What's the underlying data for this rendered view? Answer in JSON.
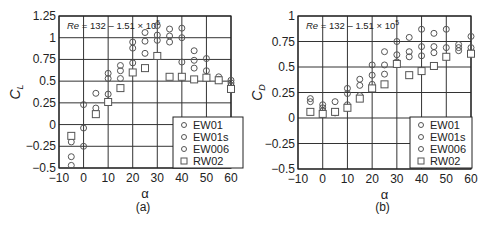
{
  "chart_data": [
    {
      "id": "a",
      "type": "scatter",
      "caption": "(a)",
      "annotation": "Re = 132 – 1.51 × 10^5",
      "xlabel": "α",
      "ylabel": "C_L",
      "xlim": [
        -10,
        60
      ],
      "ylim": [
        -0.5,
        1.25
      ],
      "xticks": [
        "-10",
        "0",
        "10",
        "20",
        "30",
        "40",
        "50",
        "60"
      ],
      "yticks": [
        "-0.5",
        "-0.25",
        "0",
        "0.25",
        "0.5",
        "0.75",
        "1",
        "1.25"
      ],
      "grid": true,
      "legend_position": "lower right",
      "legend": [
        {
          "name": "EW01",
          "marker": "circle"
        },
        {
          "name": "EW01s",
          "marker": "circle"
        },
        {
          "name": "EW006",
          "marker": "circle"
        },
        {
          "name": "RW02",
          "marker": "square"
        }
      ],
      "series": [
        {
          "name": "EW01 / EW01s / EW006",
          "marker": "circle",
          "points": [
            [
              -5,
              -0.2
            ],
            [
              -5,
              -0.37
            ],
            [
              -5,
              -0.47
            ],
            [
              0,
              0.23
            ],
            [
              0,
              -0.04
            ],
            [
              0,
              -0.25
            ],
            [
              5,
              0.36
            ],
            [
              5,
              0.19
            ],
            [
              10,
              0.59
            ],
            [
              10,
              0.53
            ],
            [
              10,
              0.35
            ],
            [
              10,
              0.27
            ],
            [
              15,
              0.68
            ],
            [
              15,
              0.62
            ],
            [
              15,
              0.53
            ],
            [
              20,
              0.95
            ],
            [
              20,
              0.88
            ],
            [
              20,
              0.71
            ],
            [
              25,
              1.06
            ],
            [
              25,
              0.96
            ],
            [
              25,
              0.82
            ],
            [
              30,
              1.14
            ],
            [
              30,
              1.03
            ],
            [
              30,
              0.97
            ],
            [
              35,
              1.1
            ],
            [
              35,
              1.02
            ],
            [
              35,
              0.95
            ],
            [
              40,
              1.11
            ],
            [
              40,
              1.0
            ],
            [
              40,
              0.72
            ],
            [
              45,
              0.85
            ],
            [
              45,
              0.74
            ],
            [
              45,
              0.65
            ],
            [
              50,
              0.76
            ],
            [
              50,
              0.62
            ],
            [
              55,
              0.55
            ],
            [
              55,
              0.52
            ],
            [
              60,
              0.51
            ],
            [
              60,
              0.48
            ],
            [
              60,
              0.45
            ]
          ]
        },
        {
          "name": "RW02",
          "marker": "square",
          "points": [
            [
              -5,
              -0.13
            ],
            [
              5,
              0.12
            ],
            [
              10,
              0.26
            ],
            [
              15,
              0.42
            ],
            [
              20,
              0.6
            ],
            [
              25,
              0.65
            ],
            [
              30,
              0.79
            ],
            [
              35,
              0.55
            ],
            [
              40,
              0.55
            ],
            [
              45,
              0.52
            ],
            [
              50,
              0.54
            ],
            [
              55,
              0.51
            ],
            [
              60,
              0.41
            ]
          ]
        }
      ]
    },
    {
      "id": "b",
      "type": "scatter",
      "caption": "(b)",
      "annotation": "Re = 132 – 1.51 × 10^5",
      "xlabel": "α",
      "ylabel": "C_D",
      "xlim": [
        -10,
        60
      ],
      "ylim": [
        -0.5,
        1
      ],
      "xticks": [
        "-10",
        "0",
        "10",
        "20",
        "30",
        "40",
        "50",
        "60"
      ],
      "yticks": [
        "-0.5",
        "-0.25",
        "0",
        "0.25",
        "0.5",
        "0.75",
        "1"
      ],
      "grid": true,
      "legend_position": "lower right",
      "legend": [
        {
          "name": "EW01",
          "marker": "circle"
        },
        {
          "name": "EW01s",
          "marker": "circle"
        },
        {
          "name": "EW006",
          "marker": "circle"
        },
        {
          "name": "RW02",
          "marker": "square"
        }
      ],
      "series": [
        {
          "name": "EW01 / EW01s / EW006",
          "marker": "circle",
          "points": [
            [
              -5,
              0.19
            ],
            [
              -5,
              0.16
            ],
            [
              0,
              0.13
            ],
            [
              0,
              0.1
            ],
            [
              0,
              0.07
            ],
            [
              5,
              0.16
            ],
            [
              5,
              0.06
            ],
            [
              5,
              0.05
            ],
            [
              10,
              0.29
            ],
            [
              10,
              0.24
            ],
            [
              10,
              0.13
            ],
            [
              15,
              0.38
            ],
            [
              15,
              0.32
            ],
            [
              15,
              0.22
            ],
            [
              20,
              0.52
            ],
            [
              20,
              0.42
            ],
            [
              20,
              0.33
            ],
            [
              25,
              0.65
            ],
            [
              25,
              0.52
            ],
            [
              25,
              0.43
            ],
            [
              30,
              0.75
            ],
            [
              30,
              0.62
            ],
            [
              30,
              0.55
            ],
            [
              35,
              0.79
            ],
            [
              35,
              0.65
            ],
            [
              35,
              0.6
            ],
            [
              40,
              0.87
            ],
            [
              40,
              0.7
            ],
            [
              40,
              0.61
            ],
            [
              45,
              0.83
            ],
            [
              45,
              0.7
            ],
            [
              45,
              0.64
            ],
            [
              50,
              0.87
            ],
            [
              50,
              0.69
            ],
            [
              55,
              0.72
            ],
            [
              55,
              0.69
            ],
            [
              55,
              0.66
            ],
            [
              60,
              0.8
            ],
            [
              60,
              0.69
            ]
          ]
        },
        {
          "name": "RW02",
          "marker": "square",
          "points": [
            [
              -5,
              0.06
            ],
            [
              0,
              0.04
            ],
            [
              5,
              0.06
            ],
            [
              10,
              0.1
            ],
            [
              15,
              0.19
            ],
            [
              20,
              0.29
            ],
            [
              25,
              0.33
            ],
            [
              30,
              0.53
            ],
            [
              35,
              0.42
            ],
            [
              40,
              0.46
            ],
            [
              45,
              0.51
            ],
            [
              50,
              0.6
            ],
            [
              60,
              0.63
            ]
          ]
        }
      ]
    }
  ],
  "colors": {
    "axis": "#222222",
    "grid": "#333333",
    "marker": "#555555",
    "background": "#ffffff"
  }
}
